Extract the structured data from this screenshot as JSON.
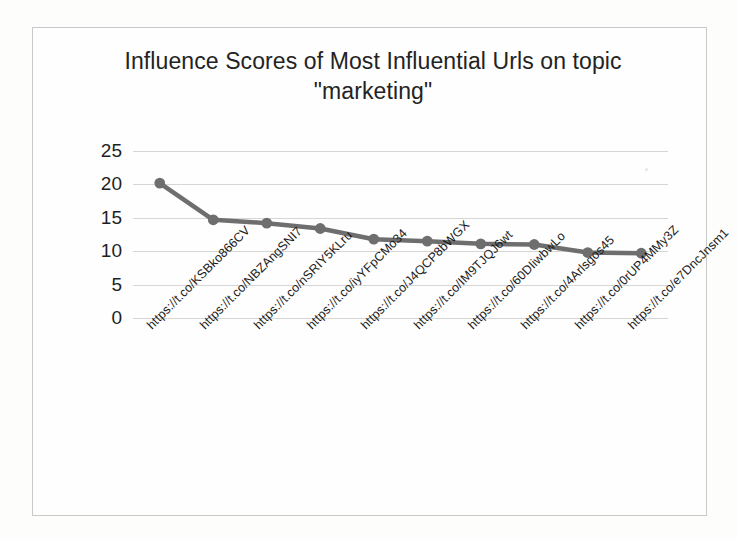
{
  "chart_data": {
    "type": "line",
    "title": "Influence Scores of Most Influential Urls on topic \"marketing\"",
    "title_line1": "Influence Scores of Most Influential Urls on",
    "title_line2": "topic \"marketing\"",
    "xlabel": "",
    "ylabel": "",
    "ylim": [
      0,
      25
    ],
    "yticks": [
      0,
      5,
      10,
      15,
      20,
      25
    ],
    "ytick_labels": [
      "0",
      "5",
      "10",
      "15",
      "20",
      "25"
    ],
    "grid": true,
    "legend": false,
    "legend_position": "none",
    "marker": "circle",
    "series_color": "#6e6e6e",
    "categories": [
      "https://t.co/KSBko866CV",
      "https://t.co/NBZAngSNI7",
      "https://t.co/nSRIY5KLru",
      "https://t.co/iyYFpCMo34",
      "https://t.co/J4QCP8bWGX",
      "https://t.co/IM9TJQJ6wt",
      "https://t.co/60DIiwbwLo",
      "https://t.co/4Arlsgos45",
      "https://t.co/0rUP4MMy3Z",
      "https://t.co/e7DncJnsm1"
    ],
    "values": [
      20.2,
      14.7,
      14.2,
      13.4,
      11.8,
      11.5,
      11.1,
      11.0,
      9.8,
      9.7
    ]
  },
  "colors": {
    "series": "#6e6e6e",
    "gridline": "#d6d6d6",
    "frame": "#c9c9c9",
    "text": "#1f1f1f",
    "background": "#fefefe"
  }
}
